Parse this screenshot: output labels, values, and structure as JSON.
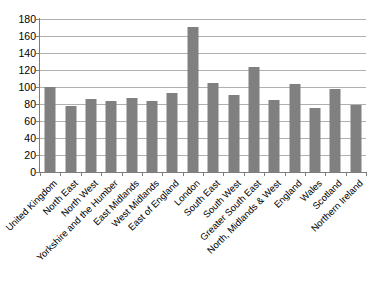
{
  "chart_data": {
    "type": "bar",
    "title": "",
    "subtitle": "",
    "xlabel": "",
    "ylabel": "",
    "ylim": [
      0,
      180
    ],
    "ytick_step": 20,
    "yticks": [
      180,
      160,
      140,
      120,
      100,
      80,
      60,
      40,
      20,
      0
    ],
    "grid": true,
    "legend": false,
    "legend_position": "none",
    "bar_color": "#808080",
    "gridline_color": "#b0b0b0",
    "axis_color": "#7d7d7d",
    "categories": [
      "United Kingdom",
      "North East",
      "North West",
      "Yorkshire and the Humber",
      "East Midlands",
      "West Midlands",
      "East of England",
      "London",
      "South East",
      "South West",
      "Greater South East",
      "North, Midlands & West",
      "England",
      "Wales",
      "Scotland",
      "Northern Ireland"
    ],
    "values": [
      100,
      78,
      86,
      83,
      87,
      84,
      93,
      171,
      105,
      91,
      124,
      85,
      103,
      75,
      98,
      79
    ]
  }
}
